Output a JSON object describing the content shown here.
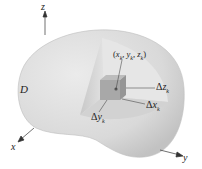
{
  "figure": {
    "region_label": "D",
    "point_label": "(x_k, y_k, z_k)",
    "point_label_parts": {
      "open": "(",
      "x": "x",
      "xk": "k",
      "sep1": ", ",
      "y": "y",
      "yk": "k",
      "sep2": ", ",
      "z": "z",
      "zk": "k",
      "close": ")"
    },
    "delta_z": {
      "delta": "Δ",
      "var": "z",
      "sub": "k"
    },
    "delta_x": {
      "delta": "Δ",
      "var": "x",
      "sub": "k"
    },
    "delta_y": {
      "delta": "Δ",
      "var": "y",
      "sub": "k"
    },
    "axes": {
      "x": "x",
      "y": "y",
      "z": "z"
    },
    "colors": {
      "solid_fill": "#dcdcdc",
      "solid_shade": "#c4c4c4",
      "cutaway_wall": "#cfcfcf",
      "box_fill": "#a9a9a9",
      "line": "#333333"
    }
  }
}
